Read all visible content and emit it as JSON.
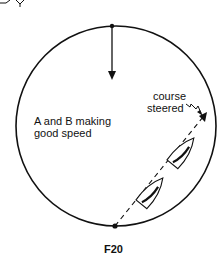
{
  "diagram": {
    "figure_label": "F20",
    "main_label_line1": "A and B making",
    "main_label_line2": "good speed",
    "course_label_line1": "course",
    "course_label_line2": "steered",
    "colors": {
      "ink": "#111111",
      "background": "#ffffff"
    },
    "elements": {
      "circle": "rotation-circle",
      "wind_arrow": "arrow-pointing-down-from-top",
      "boats": [
        "boat-B-lower",
        "boat-A-upper"
      ],
      "course_line": "dashed-line-with-arrow"
    }
  }
}
